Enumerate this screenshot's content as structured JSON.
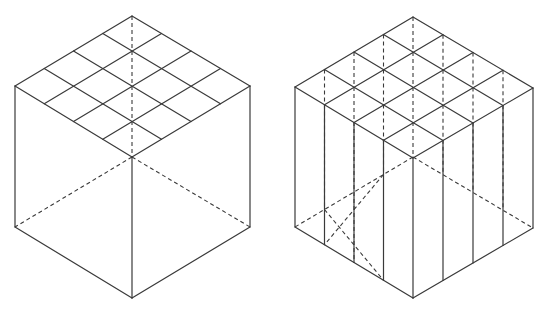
{
  "figure": {
    "width": 543,
    "height": 309,
    "stroke_color": "#3a3a3a",
    "background": "#ffffff"
  },
  "cubes": [
    {
      "id": "left-cube",
      "description": "Isometric cube with 4x4 grid on top face; hidden edges dashed",
      "top": [
        132,
        16
      ],
      "left": [
        15,
        86
      ],
      "right": [
        250,
        86
      ],
      "front": [
        132,
        157
      ],
      "height": 141,
      "grid": 4,
      "vertical_slices": false
    },
    {
      "id": "right-cube",
      "description": "Isometric cube with 4x4 grid on top face, sliced into vertical columns; hidden edges dashed",
      "top": [
        413,
        17
      ],
      "left": [
        295,
        87
      ],
      "right": [
        533,
        88
      ],
      "front": [
        413,
        158
      ],
      "height": 140,
      "grid": 4,
      "vertical_slices": true
    }
  ]
}
